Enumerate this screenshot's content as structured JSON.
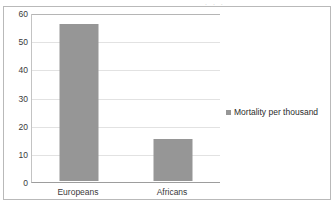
{
  "chart_data": {
    "type": "bar",
    "title": "",
    "subtitle": "",
    "xlabel": "",
    "ylabel": "",
    "categories": [
      "Europeans",
      "Africans"
    ],
    "values": [
      56,
      15
    ],
    "series": [
      {
        "name": "Mortality per thousand",
        "values": [
          56,
          15
        ]
      }
    ],
    "ylim": [
      0,
      60
    ],
    "y_ticks": [
      60,
      50,
      40,
      30,
      20,
      10,
      0
    ],
    "y_tick_labels": [
      "60",
      "50",
      "40",
      "30",
      "20",
      "10",
      "0"
    ],
    "grid": true,
    "grid_axis": "y",
    "legend": {
      "position": "right",
      "entries": [
        {
          "label": "Mortality per thousand",
          "color": "#969696",
          "marker": "square"
        }
      ]
    },
    "bar_color": "#969696",
    "plot_background": "#ffffff",
    "frame_border_color": "#b9b9b9",
    "gridline_color": "#e2e2e2",
    "axis_color": "#9d9d9d"
  },
  "scan": {
    "top_artifact_text": ". .                     ."
  }
}
